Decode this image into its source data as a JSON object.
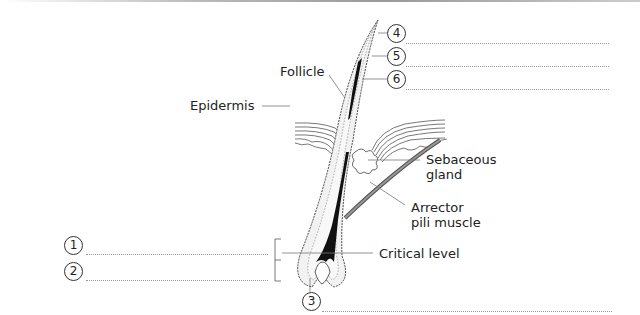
{
  "figure": {
    "labels": {
      "follicle": "Follicle",
      "epidermis": "Epidermis",
      "sebaceous_gland": "Sebaceous\ngland",
      "sebaceous_line1": "Sebaceous",
      "sebaceous_line2": "gland",
      "arrector_line1": "Arrector",
      "arrector_line2": "pili muscle",
      "critical_level": "Critical level"
    },
    "numbered_callouts": [
      {
        "number": "1",
        "answer": ""
      },
      {
        "number": "2",
        "answer": ""
      },
      {
        "number": "3",
        "answer": ""
      },
      {
        "number": "4",
        "answer": ""
      },
      {
        "number": "5",
        "answer": ""
      },
      {
        "number": "6",
        "answer": ""
      }
    ]
  }
}
